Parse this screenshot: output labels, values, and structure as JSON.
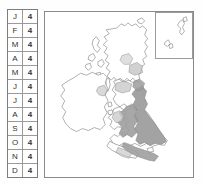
{
  "figure": {
    "kind": "species-distribution-map",
    "region": "British Isles"
  },
  "phenology_table": {
    "columns": [
      "month",
      "value"
    ],
    "rows": [
      {
        "month": "J",
        "value": "4"
      },
      {
        "month": "F",
        "value": "4"
      },
      {
        "month": "M",
        "value": "4"
      },
      {
        "month": "A",
        "value": "4"
      },
      {
        "month": "M",
        "value": "4"
      },
      {
        "month": "J",
        "value": "4"
      },
      {
        "month": "J",
        "value": "4"
      },
      {
        "month": "A",
        "value": "4"
      },
      {
        "month": "S",
        "value": "4"
      },
      {
        "month": "O",
        "value": "4"
      },
      {
        "month": "N",
        "value": "4"
      },
      {
        "month": "D",
        "value": "4"
      }
    ]
  },
  "colors": {
    "frame": "#8a8a8a",
    "table_border": "#7d7d7d",
    "cell_rule": "#9a9a9a",
    "coastline": "#6f6f6f",
    "shaded_fill": "#9e9e9e",
    "light_fill": "#c9c9c9",
    "land_fill": "#ffffff",
    "background": "#ffffff",
    "text": "#333333"
  },
  "map": {
    "main_panel_name": "british-isles-map",
    "inset_panel_name": "shetland-inset",
    "shaded_regions_label": "distribution-shading"
  }
}
